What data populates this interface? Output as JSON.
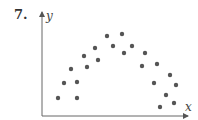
{
  "problem": {
    "number_label": "7."
  },
  "chart_data": {
    "type": "scatter",
    "title": "",
    "xlabel": "x",
    "ylabel": "y",
    "grid": false,
    "legend": null,
    "axis_ticks": "none",
    "pixel_frame": {
      "origin_x": 42,
      "origin_y": 116,
      "x_axis_end": 188,
      "y_axis_top": 12
    },
    "colors": {
      "points": "#555555",
      "axes": "#666666"
    },
    "point_radius": 2.2,
    "points": [
      {
        "x": 16,
        "y": 18
      },
      {
        "x": 35,
        "y": 18
      },
      {
        "x": 22,
        "y": 33
      },
      {
        "x": 35,
        "y": 34
      },
      {
        "x": 29,
        "y": 47
      },
      {
        "x": 45,
        "y": 49
      },
      {
        "x": 42,
        "y": 60
      },
      {
        "x": 56,
        "y": 56
      },
      {
        "x": 53,
        "y": 68
      },
      {
        "x": 65,
        "y": 80
      },
      {
        "x": 71,
        "y": 70
      },
      {
        "x": 80,
        "y": 82
      },
      {
        "x": 82,
        "y": 63
      },
      {
        "x": 90,
        "y": 70
      },
      {
        "x": 103,
        "y": 63
      },
      {
        "x": 100,
        "y": 50
      },
      {
        "x": 115,
        "y": 52
      },
      {
        "x": 112,
        "y": 33
      },
      {
        "x": 128,
        "y": 41
      },
      {
        "x": 134,
        "y": 31
      },
      {
        "x": 124,
        "y": 21
      },
      {
        "x": 118,
        "y": 9
      },
      {
        "x": 132,
        "y": 13
      }
    ]
  }
}
